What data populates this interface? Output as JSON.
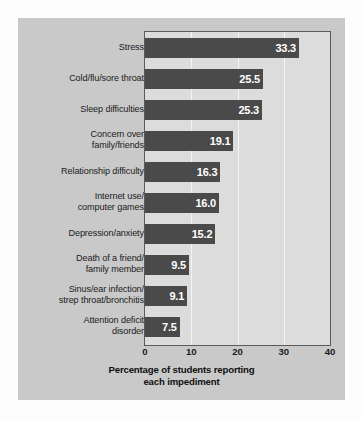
{
  "chart_data": {
    "type": "bar",
    "orientation": "horizontal",
    "title": "",
    "xlabel": "Percentage of students reporting each impediment",
    "ylabel": "",
    "xlim": [
      0,
      40
    ],
    "xticks": [
      0,
      10,
      20,
      30,
      40
    ],
    "xtick_labels": [
      "0",
      "10",
      "20",
      "30",
      "40"
    ],
    "grid": true,
    "grid_axis": "x",
    "legend": false,
    "categories": [
      "Stress",
      "Cold/flu/sore throat",
      "Sleep difficulties",
      "Concern over family/friends",
      "Relationship difficulty",
      "Internet use/ computer games",
      "Depression/anxiety",
      "Death of a friend/ family member",
      "Sinus/ear infection/ strep throat/bronchitis",
      "Attention deficit disorder"
    ],
    "category_lines": [
      [
        "Stress"
      ],
      [
        "Cold/flu/sore throat"
      ],
      [
        "Sleep difficulties"
      ],
      [
        "Concern over",
        "family/friends"
      ],
      [
        "Relationship difficulty"
      ],
      [
        "Internet use/",
        "computer games"
      ],
      [
        "Depression/anxiety"
      ],
      [
        "Death of a friend/",
        "family member"
      ],
      [
        "Sinus/ear infection/",
        "strep throat/bronchitis"
      ],
      [
        "Attention deficit",
        "disorder"
      ]
    ],
    "values": [
      33.3,
      25.5,
      25.3,
      19.1,
      16.3,
      16.0,
      15.2,
      9.5,
      9.1,
      7.5
    ],
    "value_labels": [
      "33.3",
      "25.5",
      "25.3",
      "19.1",
      "16.3",
      "16.0",
      "15.2",
      "9.5",
      "9.1",
      "7.5"
    ],
    "xlabel_lines": [
      "Percentage of students reporting",
      "each impediment"
    ],
    "colors": {
      "bar": "#4a4a4a",
      "value_text": "#ffffff",
      "plot_background": "#dcdcdc",
      "panel_background": "#c9c9c9",
      "gridline": "#f4f4f4",
      "axis_border": "#5a5a5a",
      "label_text": "#1b1b1b"
    }
  }
}
